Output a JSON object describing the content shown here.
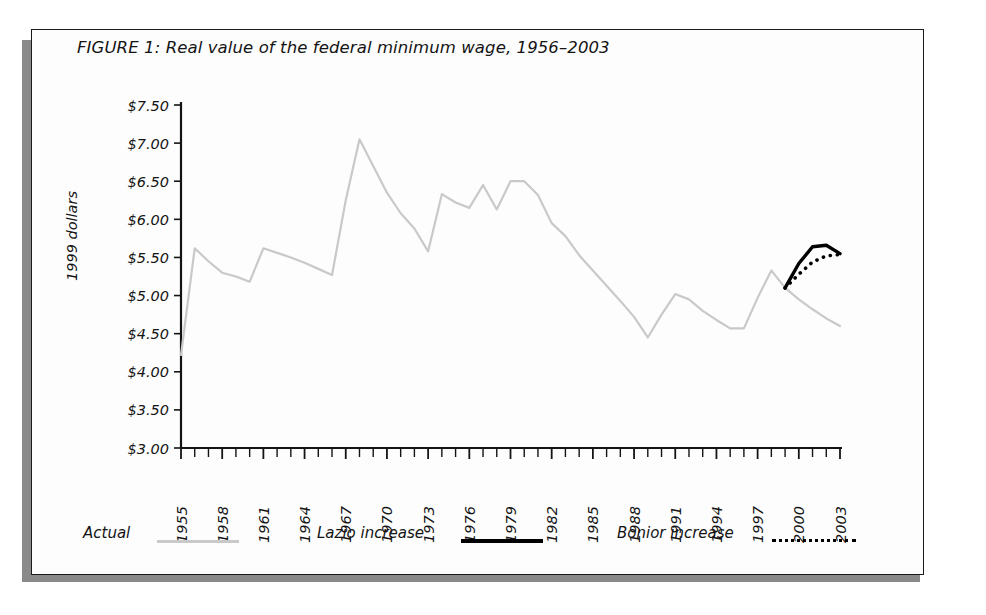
{
  "figure": {
    "title": "FIGURE 1: Real value of the federal minimum wage, 1956–2003",
    "ylabel": "1999 dollars"
  },
  "legend": {
    "items": [
      {
        "label": "Actual",
        "style": "solid",
        "color": "#c9c9c9"
      },
      {
        "label": "Lazio increase",
        "style": "solid",
        "color": "#000000"
      },
      {
        "label": "Bonior increase",
        "style": "dotted",
        "color": "#000000"
      }
    ]
  },
  "chart_data": {
    "type": "line",
    "title": "FIGURE 1: Real value of the federal minimum wage, 1956–2003",
    "xlabel": "",
    "ylabel": "1999 dollars",
    "xlim": [
      1955,
      2003
    ],
    "ylim": [
      3.0,
      7.5
    ],
    "grid": false,
    "legend_position": "bottom",
    "ytick_labels": [
      "$3.00",
      "$3.50",
      "$4.00",
      "$4.50",
      "$5.00",
      "$5.50",
      "$6.00",
      "$6.50",
      "$7.00",
      "$7.50"
    ],
    "ytick_values": [
      3.0,
      3.5,
      4.0,
      4.5,
      5.0,
      5.5,
      6.0,
      6.5,
      7.0,
      7.5
    ],
    "xtick_labels": [
      "1955",
      "1958",
      "1961",
      "1964",
      "1967",
      "1970",
      "1973",
      "1976",
      "1979",
      "1982",
      "1985",
      "1988",
      "1991",
      "1994",
      "1997",
      "2000",
      "2003"
    ],
    "xtick_values": [
      1955,
      1958,
      1961,
      1964,
      1967,
      1970,
      1973,
      1976,
      1979,
      1982,
      1985,
      1988,
      1991,
      1994,
      1997,
      2000,
      2003
    ],
    "xtick_minor_step": 1,
    "series": [
      {
        "name": "Actual",
        "color": "#c9c9c9",
        "style": "solid",
        "x": [
          1955,
          1956,
          1957,
          1958,
          1959,
          1960,
          1961,
          1962,
          1963,
          1964,
          1965,
          1966,
          1967,
          1968,
          1969,
          1970,
          1971,
          1972,
          1973,
          1974,
          1975,
          1976,
          1977,
          1978,
          1979,
          1980,
          1981,
          1982,
          1983,
          1984,
          1985,
          1986,
          1987,
          1988,
          1989,
          1990,
          1991,
          1992,
          1993,
          1994,
          1995,
          1996,
          1997,
          1998,
          1999,
          2000,
          2001,
          2002,
          2003
        ],
        "y": [
          4.22,
          5.62,
          5.45,
          5.3,
          5.25,
          5.18,
          5.62,
          5.56,
          5.5,
          5.43,
          5.35,
          5.27,
          6.25,
          7.05,
          6.7,
          6.35,
          6.08,
          5.88,
          5.58,
          6.33,
          6.22,
          6.15,
          6.45,
          6.13,
          6.5,
          6.5,
          6.32,
          5.95,
          5.78,
          5.53,
          5.33,
          5.13,
          4.93,
          4.72,
          4.45,
          4.75,
          5.02,
          4.95,
          4.8,
          4.68,
          4.57,
          4.57,
          4.97,
          5.33,
          5.1,
          4.95,
          4.82,
          4.7,
          4.6
        ]
      },
      {
        "name": "Lazio increase",
        "color": "#000000",
        "style": "solid",
        "x": [
          1999,
          2000,
          2001,
          2002,
          2003
        ],
        "y": [
          5.1,
          5.42,
          5.64,
          5.66,
          5.55
        ]
      },
      {
        "name": "Bonior increase",
        "color": "#000000",
        "style": "dotted",
        "x": [
          1999,
          2000,
          2001,
          2002,
          2003
        ],
        "y": [
          5.1,
          5.28,
          5.44,
          5.52,
          5.54
        ]
      }
    ]
  }
}
